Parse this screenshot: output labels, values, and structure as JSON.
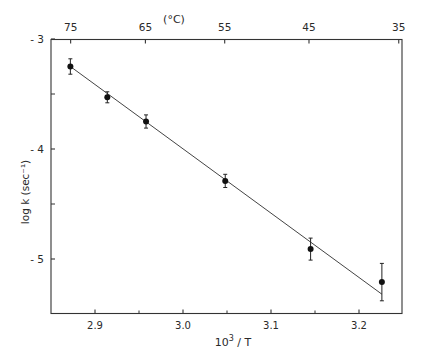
{
  "chart_data": {
    "type": "scatter",
    "title": "",
    "xlabel": "10³ / T",
    "xlabel_base": "10",
    "xlabel_sup": "3",
    "xlabel_rest": " / T",
    "ylabel": "log k (sec⁻¹)",
    "top_axis_label": "(°C)",
    "xlim": [
      2.85,
      3.25
    ],
    "ylim": [
      -5.5,
      -3.0
    ],
    "grid": false,
    "legend": null,
    "x_ticks": [
      2.9,
      3.0,
      3.1,
      3.2
    ],
    "x_tick_labels": [
      "2.9",
      "3.0",
      "3.1",
      "3.2"
    ],
    "x_minor_ticks": [
      2.95,
      3.05,
      3.15
    ],
    "y_ticks": [
      -3,
      -4,
      -5
    ],
    "y_tick_labels": [
      "-3",
      "-4",
      "-5"
    ],
    "y_minor_ticks": [
      -3.5,
      -4.5
    ],
    "top_ticks_celsius": [
      75,
      65,
      55,
      45,
      35
    ],
    "top_tick_labels": [
      "75",
      "65",
      "55",
      "45",
      "35"
    ],
    "series": [
      {
        "name": "measured",
        "marker": "filled-circle",
        "x": [
          2.872,
          2.914,
          2.958,
          3.048,
          3.145,
          3.226
        ],
        "y": [
          -3.25,
          -3.53,
          -3.75,
          -4.29,
          -4.91,
          -5.21
        ],
        "yerr": [
          0.07,
          0.05,
          0.06,
          0.06,
          0.1,
          0.17
        ]
      },
      {
        "name": "linear fit",
        "type": "line",
        "x": [
          2.872,
          3.226
        ],
        "y": [
          -3.25,
          -5.32
        ]
      }
    ]
  }
}
